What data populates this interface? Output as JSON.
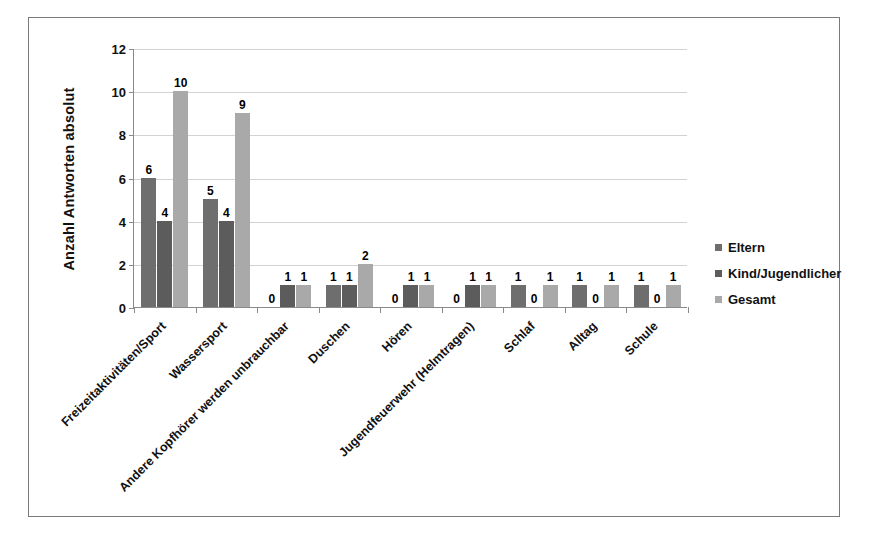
{
  "chart_data": {
    "type": "bar",
    "title": "",
    "subtitle": "",
    "xlabel": "",
    "ylabel": "Anzahl Antworten absolut",
    "ylim": [
      0,
      12
    ],
    "yticks": [
      0,
      2,
      4,
      6,
      8,
      10,
      12
    ],
    "grid": true,
    "legend_position": "right",
    "orientation": "vertical",
    "grouping": "clustered",
    "categories": [
      "Freizeitaktivitäten/Sport",
      "Wassersport",
      "Andere Kopfhörer werden unbrauchbar",
      "Duschen",
      "Hören",
      "Jugendfeuerwehr (Helmtragen)",
      "Schlaf",
      "Alltag",
      "Schule"
    ],
    "series": [
      {
        "name": "Eltern",
        "color": "#6e6e6e",
        "values": [
          6,
          5,
          0,
          1,
          0,
          0,
          1,
          1,
          1
        ]
      },
      {
        "name": "Kind/Jugendlicher",
        "color": "#5c5c5c",
        "values": [
          4,
          4,
          1,
          1,
          1,
          1,
          0,
          0,
          0
        ]
      },
      {
        "name": "Gesamt",
        "color": "#a9a9a9",
        "values": [
          10,
          9,
          1,
          2,
          1,
          1,
          1,
          1,
          1
        ]
      }
    ]
  },
  "legend": {
    "items": [
      {
        "label": "Eltern",
        "color": "#6e6e6e"
      },
      {
        "label": "Kind/Jugendlicher",
        "color": "#5c5c5c"
      },
      {
        "label": "Gesamt",
        "color": "#a9a9a9"
      }
    ]
  }
}
